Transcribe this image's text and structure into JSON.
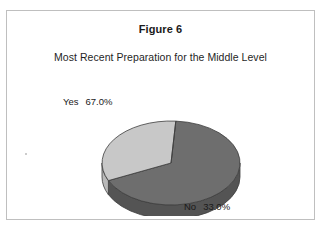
{
  "figure": {
    "title": "Figure 6",
    "subtitle": "Most Recent Preparation for the Middle Level"
  },
  "labels": {
    "yes_name": "Yes",
    "yes_value": "67.0%",
    "no_name": "No",
    "no_value": "33.0%"
  },
  "colors": {
    "slice_yes_top": "#6e6e6e",
    "slice_yes_side": "#545454",
    "slice_no_top": "#c8c8c8",
    "slice_no_side": "#b4b4b4",
    "outline": "#3d3d3d",
    "frame": "#bfbfbf",
    "background": "#ffffff",
    "text": "#1a1a1a"
  },
  "chart_data": {
    "type": "pie",
    "title": "Figure 6",
    "subtitle": "Most Recent Preparation for the Middle Level",
    "categories": [
      "Yes",
      "No"
    ],
    "values": [
      67.0,
      33.0
    ],
    "value_labels": [
      "67.0%",
      "33.0%"
    ],
    "units": "percent",
    "total": 100.0,
    "three_d": true,
    "legend": "none",
    "data_labels_position": "outside",
    "slice_colors": [
      "#6e6e6e",
      "#c8c8c8"
    ],
    "start_angle_deg": 4,
    "direction": "clockwise"
  }
}
